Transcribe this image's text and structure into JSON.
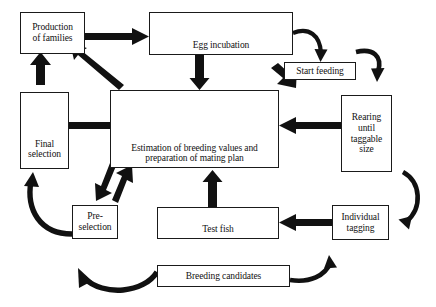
{
  "diagram": {
    "background_color": "#ffffff",
    "line_color": "#111111",
    "nodes": [
      {
        "id": "production-of-families",
        "label": "Production\nof families"
      },
      {
        "id": "egg-incubation",
        "label": "Egg incubation"
      },
      {
        "id": "start-feeding",
        "label": "Start feeding"
      },
      {
        "id": "rearing-until-taggable-size",
        "label": "Rearing\nuntil\ntaggable\nsize"
      },
      {
        "id": "estimation-of-breeding-values",
        "label": "Estimation of breeding values and\npreparation of mating plan"
      },
      {
        "id": "final-selection",
        "label": "Final\nselection"
      },
      {
        "id": "pre-selection",
        "label": "Pre-\nselection"
      },
      {
        "id": "test-fish",
        "label": "Test fish"
      },
      {
        "id": "individual-tagging",
        "label": "Individual\ntagging"
      },
      {
        "id": "breeding-candidates",
        "label": "Breeding candidates"
      }
    ],
    "edges": [
      {
        "from": "production-of-families",
        "to": "egg-incubation",
        "style": "straight-arrow",
        "direction": "right"
      },
      {
        "from": "egg-incubation",
        "to": "start-feeding",
        "style": "curved-arrow",
        "direction": "down-right"
      },
      {
        "from": "egg-incubation",
        "to": "estimation-of-breeding-values",
        "style": "straight-arrow",
        "direction": "down"
      },
      {
        "from": "start-feeding",
        "to": "estimation-of-breeding-values",
        "style": "straight-arrow",
        "direction": "down-left"
      },
      {
        "from": "start-feeding",
        "to": "rearing-until-taggable-size",
        "style": "curved-arrow",
        "direction": "right-down"
      },
      {
        "from": "rearing-until-taggable-size",
        "to": "estimation-of-breeding-values",
        "style": "straight-arrow",
        "direction": "left"
      },
      {
        "from": "rearing-until-taggable-size",
        "to": "individual-tagging",
        "style": "curved-arrow",
        "direction": "down"
      },
      {
        "from": "individual-tagging",
        "to": "test-fish",
        "style": "straight-arrow",
        "direction": "left"
      },
      {
        "from": "test-fish",
        "to": "estimation-of-breeding-values",
        "style": "straight-arrow",
        "direction": "up"
      },
      {
        "from": "breeding-candidates",
        "to": "individual-tagging",
        "style": "curved-arrow",
        "direction": "right-up"
      },
      {
        "from": "breeding-candidates",
        "to": "pre-selection",
        "style": "curved-arrow",
        "direction": "left-up"
      },
      {
        "from": "pre-selection",
        "to": "estimation-of-breeding-values",
        "style": "straight-arrow",
        "direction": "up-right"
      },
      {
        "from": "estimation-of-breeding-values",
        "to": "pre-selection",
        "style": "straight-arrow",
        "direction": "down-left"
      },
      {
        "from": "pre-selection",
        "to": "final-selection",
        "style": "curved-arrow",
        "direction": "left-up"
      },
      {
        "from": "estimation-of-breeding-values",
        "to": "final-selection",
        "style": "straight-arrow",
        "direction": "left"
      },
      {
        "from": "estimation-of-breeding-values",
        "to": "production-of-families",
        "style": "straight-arrow",
        "direction": "up-left"
      },
      {
        "from": "final-selection",
        "to": "production-of-families",
        "style": "straight-arrow",
        "direction": "up"
      }
    ]
  }
}
